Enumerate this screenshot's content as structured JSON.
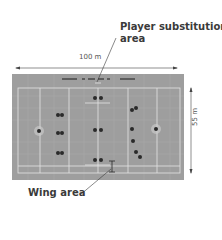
{
  "diagram": {
    "type": "field-layout",
    "labels": {
      "substitution_line1": "Player substitution",
      "substitution_line2": "area",
      "wing": "Wing area",
      "length": "100 m",
      "width": "55 m"
    },
    "colors": {
      "field": "#9b9b9b",
      "lines": "#e6e6e6",
      "players": "#2a2a2a",
      "text": "#3a3a3a"
    },
    "field": {
      "length_m": 100,
      "width_m": 55
    },
    "players": {
      "left_team": [
        {
          "x": 39,
          "y": 131,
          "role": "goalkeeper"
        },
        {
          "x": 58,
          "y": 115
        },
        {
          "x": 62,
          "y": 115
        },
        {
          "x": 58,
          "y": 133
        },
        {
          "x": 62,
          "y": 133
        },
        {
          "x": 58,
          "y": 153
        },
        {
          "x": 62,
          "y": 153
        }
      ],
      "center": [
        {
          "x": 95,
          "y": 98
        },
        {
          "x": 101,
          "y": 98
        },
        {
          "x": 95,
          "y": 130
        },
        {
          "x": 101,
          "y": 130
        },
        {
          "x": 95,
          "y": 160
        },
        {
          "x": 101,
          "y": 160
        }
      ],
      "right_team": [
        {
          "x": 132,
          "y": 110
        },
        {
          "x": 136,
          "y": 108
        },
        {
          "x": 132,
          "y": 129
        },
        {
          "x": 133,
          "y": 141
        },
        {
          "x": 136,
          "y": 152
        },
        {
          "x": 140,
          "y": 157
        },
        {
          "x": 156,
          "y": 129,
          "role": "goalkeeper"
        }
      ]
    }
  }
}
